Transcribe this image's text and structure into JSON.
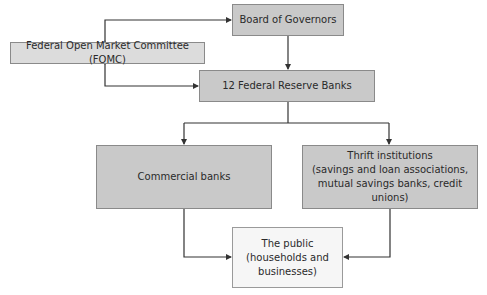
{
  "diagram": {
    "type": "organizational-flowchart",
    "nodes": {
      "board": {
        "label": "Board of Governors"
      },
      "fomc": {
        "label": "Federal Open Market Committee (FOMC)"
      },
      "frb": {
        "label": "12 Federal Reserve Banks"
      },
      "commercial": {
        "label": "Commercial banks"
      },
      "thrift": {
        "line1": "Thrift institutions",
        "line2": "(savings and loan associations,",
        "line3": "mutual savings banks, credit unions)"
      },
      "public": {
        "line1": "The public",
        "line2": "(households and",
        "line3": "businesses)"
      }
    },
    "edges": [
      {
        "from": "board",
        "to": "fomc",
        "bidirectional": true
      },
      {
        "from": "fomc",
        "to": "frb",
        "bidirectional": true
      },
      {
        "from": "board",
        "to": "frb"
      },
      {
        "from": "frb",
        "to": "commercial"
      },
      {
        "from": "frb",
        "to": "thrift"
      },
      {
        "from": "commercial",
        "to": "public"
      },
      {
        "from": "thrift",
        "to": "public"
      }
    ],
    "colors": {
      "box_fill": "#c9c9c9",
      "fomc_fill": "#dcdcdc",
      "public_fill": "#f6f6f6",
      "line": "#333333"
    }
  }
}
